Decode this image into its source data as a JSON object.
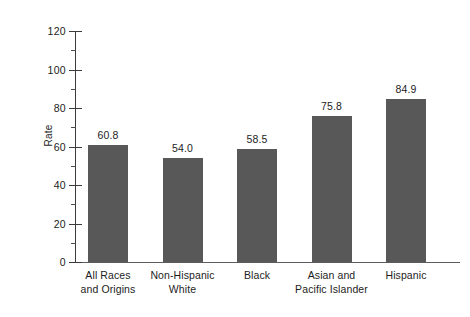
{
  "chart_data": {
    "type": "bar",
    "title": "",
    "xlabel": "",
    "ylabel": "Rate",
    "ylim": [
      0,
      120
    ],
    "yticks": [
      0,
      20,
      40,
      60,
      80,
      100,
      120
    ],
    "ytick_labels": [
      "0",
      "20",
      "40",
      "60",
      "80",
      "100",
      "120"
    ],
    "minor_tick_interval": 10,
    "grid": false,
    "legend": false,
    "bar_color": "#585858",
    "axis_color": "#3b3b3b",
    "categories": [
      "All Races and Origins",
      "Non-Hispanic White",
      "Black",
      "Asian and Pacific Islander",
      "Hispanic"
    ],
    "category_lines": [
      [
        "All Races",
        "and Origins"
      ],
      [
        "Non-Hispanic",
        "White"
      ],
      [
        "Black",
        ""
      ],
      [
        "Asian and",
        "Pacific Islander"
      ],
      [
        "Hispanic",
        ""
      ]
    ],
    "values": [
      60.8,
      54.0,
      58.5,
      75.8,
      84.9
    ],
    "value_labels": [
      "60.8",
      "54.0",
      "58.5",
      "75.8",
      "84.9"
    ]
  }
}
